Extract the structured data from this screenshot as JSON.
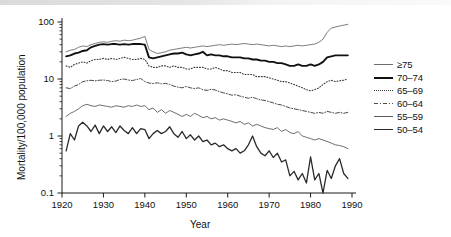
{
  "chart_data": {
    "type": "line",
    "title": "",
    "xlabel": "Year",
    "ylabel": "Mortality/100,000 population",
    "yscale": "log",
    "ylim": [
      0.1,
      100
    ],
    "xlim": [
      1920,
      1990
    ],
    "yticks": [
      "0.1",
      "1",
      "10",
      "100"
    ],
    "xticks": [
      "1920",
      "1930",
      "1940",
      "1950",
      "1960",
      "1970",
      "1980",
      "1990"
    ],
    "grid": false,
    "legend_position": "right",
    "x": [
      1921,
      1922,
      1923,
      1924,
      1925,
      1926,
      1927,
      1928,
      1929,
      1930,
      1931,
      1932,
      1933,
      1934,
      1935,
      1936,
      1937,
      1938,
      1939,
      1940,
      1941,
      1942,
      1943,
      1944,
      1945,
      1946,
      1947,
      1948,
      1949,
      1950,
      1951,
      1952,
      1953,
      1954,
      1955,
      1956,
      1957,
      1958,
      1959,
      1960,
      1961,
      1962,
      1963,
      1964,
      1965,
      1966,
      1967,
      1968,
      1969,
      1970,
      1971,
      1972,
      1973,
      1974,
      1975,
      1976,
      1977,
      1978,
      1979,
      1980,
      1981,
      1982,
      1983,
      1984,
      1985,
      1986,
      1987,
      1988,
      1989
    ],
    "series": [
      {
        "name": "≥75",
        "style": "solid",
        "width": 0.9,
        "color": "#6d6d6d",
        "values": [
          30,
          32,
          33,
          36,
          38,
          37,
          40,
          42,
          44,
          45,
          44,
          46,
          47,
          46,
          48,
          47,
          48,
          50,
          52,
          56,
          33,
          30,
          28,
          29,
          30,
          32,
          33,
          34,
          35,
          36,
          35,
          36,
          37,
          38,
          37,
          38,
          39,
          40,
          39,
          40,
          41,
          40,
          41,
          42,
          41,
          40,
          41,
          40,
          39,
          38,
          39,
          38,
          37,
          38,
          37,
          38,
          39,
          38,
          39,
          40,
          41,
          44,
          50,
          66,
          78,
          82,
          85,
          88,
          91
        ]
      },
      {
        "name": "70–74",
        "style": "solid",
        "width": 1.9,
        "color": "#111111",
        "values": [
          25,
          26,
          28,
          29,
          31,
          32,
          36,
          38,
          40,
          41,
          40,
          41,
          41,
          40,
          41,
          40,
          41,
          41,
          41,
          40,
          24,
          23,
          24,
          25,
          26,
          27,
          28,
          28,
          29,
          27,
          26,
          27,
          28,
          30,
          26,
          27,
          26,
          26,
          25,
          25,
          24,
          24,
          24,
          23,
          23,
          22,
          22,
          21,
          21,
          20,
          20,
          19,
          19,
          18,
          17,
          17,
          18,
          17,
          17,
          18,
          17,
          18,
          20,
          24,
          25,
          26,
          26,
          26,
          26
        ]
      },
      {
        "name": "65–69",
        "style": "dotted",
        "width": 1.1,
        "color": "#3a3a3a",
        "values": [
          17,
          16,
          18,
          19,
          20,
          19,
          21,
          22,
          22,
          23,
          22,
          23,
          22,
          23,
          24,
          23,
          22,
          22,
          23,
          22,
          17,
          16,
          16,
          17,
          17,
          16,
          17,
          16,
          16,
          15,
          15,
          16,
          16,
          16,
          15,
          15,
          16,
          15,
          14,
          14,
          13,
          13,
          13,
          12,
          12,
          12,
          11,
          11,
          11,
          10.5,
          10,
          9.5,
          9,
          9,
          8.5,
          8,
          7.5,
          7,
          6.5,
          6.2,
          6.5,
          7,
          8,
          9,
          9.5,
          9,
          9.3,
          9.5,
          10
        ]
      },
      {
        "name": "60–64",
        "style": "dashdot",
        "width": 1.0,
        "color": "#4a4a4a",
        "values": [
          7,
          6.8,
          7.5,
          8,
          9,
          9.3,
          9.5,
          9.3,
          9.5,
          9.6,
          9.4,
          9,
          9.2,
          9.8,
          10,
          9.6,
          9.4,
          9.8,
          10.2,
          9,
          8.5,
          8.3,
          8.6,
          8.2,
          8.4,
          8,
          7.5,
          7.2,
          7,
          7.4,
          7,
          6.8,
          7,
          6.5,
          6.3,
          6.6,
          6.4,
          6,
          5.7,
          5.5,
          5.2,
          5.3,
          5,
          4.8,
          4.6,
          4.8,
          4.5,
          4.3,
          4.2,
          4,
          3.8,
          3.6,
          3.5,
          3.3,
          3.1,
          3,
          2.9,
          2.8,
          2.7,
          2.6,
          2.5,
          2.6,
          2.5,
          2.7,
          2.6,
          2.5,
          2.6,
          2.5,
          2.6
        ]
      },
      {
        "name": "55–59",
        "style": "solid",
        "width": 0.9,
        "color": "#5c5c5c",
        "values": [
          2.2,
          2.5,
          2.7,
          3,
          3.4,
          3.6,
          3.4,
          3.3,
          3.5,
          3.4,
          3.3,
          3.2,
          3.4,
          3.3,
          3.2,
          3.4,
          3.3,
          3.5,
          3.3,
          3.4,
          2.9,
          3.1,
          2.6,
          2.9,
          2.5,
          2.8,
          2.6,
          2.4,
          2.2,
          2.4,
          2.2,
          2.5,
          2.3,
          2.1,
          2.2,
          2,
          2.1,
          1.9,
          2,
          1.9,
          1.8,
          1.7,
          1.8,
          1.6,
          1.7,
          1.5,
          1.6,
          1.5,
          1.4,
          1.35,
          1.3,
          1.4,
          1.2,
          1.3,
          1.15,
          1.1,
          1.2,
          1,
          0.95,
          0.9,
          0.85,
          0.9,
          0.85,
          0.8,
          0.75,
          0.7,
          0.68,
          0.65,
          0.6
        ]
      },
      {
        "name": "50–54",
        "style": "solid",
        "width": 1.3,
        "color": "#2a2a2a",
        "values": [
          0.55,
          1.1,
          0.85,
          1.5,
          1.75,
          1.5,
          1.2,
          1.55,
          1.1,
          1.5,
          1.2,
          1.45,
          1.15,
          1.5,
          1.25,
          1.1,
          1.4,
          1.1,
          1.35,
          1.3,
          0.9,
          1.1,
          1.25,
          1.1,
          1.2,
          1.45,
          1.1,
          0.95,
          1.2,
          0.9,
          1.05,
          0.85,
          1.0,
          0.8,
          0.85,
          0.7,
          0.75,
          0.65,
          0.7,
          0.6,
          0.55,
          0.6,
          0.5,
          0.55,
          0.7,
          1.0,
          0.65,
          0.5,
          0.45,
          0.55,
          0.42,
          0.5,
          0.35,
          0.38,
          0.2,
          0.24,
          0.17,
          0.22,
          0.15,
          0.43,
          0.17,
          0.22,
          0.1,
          0.25,
          0.18,
          0.3,
          0.4,
          0.22,
          0.18
        ]
      }
    ]
  }
}
